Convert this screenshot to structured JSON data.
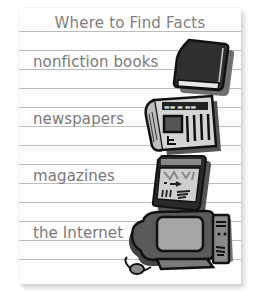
{
  "title": "Where to Find Facts",
  "items": [
    {
      "label": "nonfiction books",
      "icon": "book-icon"
    },
    {
      "label": "newspapers",
      "icon": "newspaper-icon"
    },
    {
      "label": "magazines",
      "icon": "magazine-icon"
    },
    {
      "label": "the Internet",
      "icon": "computer-icon"
    }
  ],
  "colors": {
    "paper": "#fdfdfd",
    "rule": "#bdbdbd",
    "text": "#7a7a7a",
    "icon_dark": "#2a2a2a",
    "icon_mid": "#6e6e6e",
    "icon_light": "#bcbcbc"
  }
}
